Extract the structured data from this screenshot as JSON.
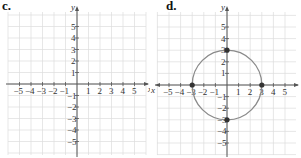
{
  "figure": {
    "panels": [
      {
        "label": "c.",
        "x_axis_label": "x",
        "y_axis_label": "y",
        "x_ticks": [
          "-5",
          "-4",
          "-3",
          "-2",
          "-1",
          "1",
          "2",
          "3",
          "4",
          "5"
        ],
        "y_ticks": [
          "5",
          "4",
          "3",
          "2",
          "1",
          "-1",
          "-2",
          "-3",
          "-4",
          "-5"
        ],
        "curve": "none"
      },
      {
        "label": "d.",
        "x_axis_label": "x",
        "y_axis_label": "y",
        "x_ticks": [
          "-5",
          "-4",
          "-3",
          "-2",
          "-1",
          "1",
          "2",
          "3",
          "4",
          "5"
        ],
        "y_ticks": [
          "5",
          "4",
          "3",
          "2",
          "1",
          "-1",
          "-2",
          "-3",
          "-4",
          "-5"
        ],
        "curve": "circle",
        "circle": {
          "center": [
            0,
            0
          ],
          "radius": 3
        },
        "points": [
          [
            -3,
            0
          ],
          [
            3,
            0
          ],
          [
            0,
            3
          ],
          [
            0,
            -3
          ]
        ]
      }
    ],
    "colors": {
      "grid": "#dcdcdc",
      "axis": "#555555",
      "curve": "#8a8a8a",
      "point": "#333333"
    }
  }
}
